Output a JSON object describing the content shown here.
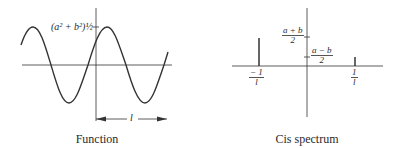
{
  "panels": [
    {
      "id": "function",
      "caption": "Function",
      "amplitude_label": "(a² + b²)½",
      "period_label": "l"
    },
    {
      "id": "cis-spectrum",
      "caption": "Cis spectrum",
      "upper_label": {
        "num": "a + b",
        "den": "2"
      },
      "lower_label": {
        "num": "a − b",
        "den": "2"
      },
      "neg_freq_label": {
        "num": "− 1",
        "den": "l"
      },
      "pos_freq_label": {
        "num": "1",
        "den": "l"
      }
    }
  ],
  "colors": {
    "ink": "#2a2a2a",
    "background": "#ffffff"
  }
}
